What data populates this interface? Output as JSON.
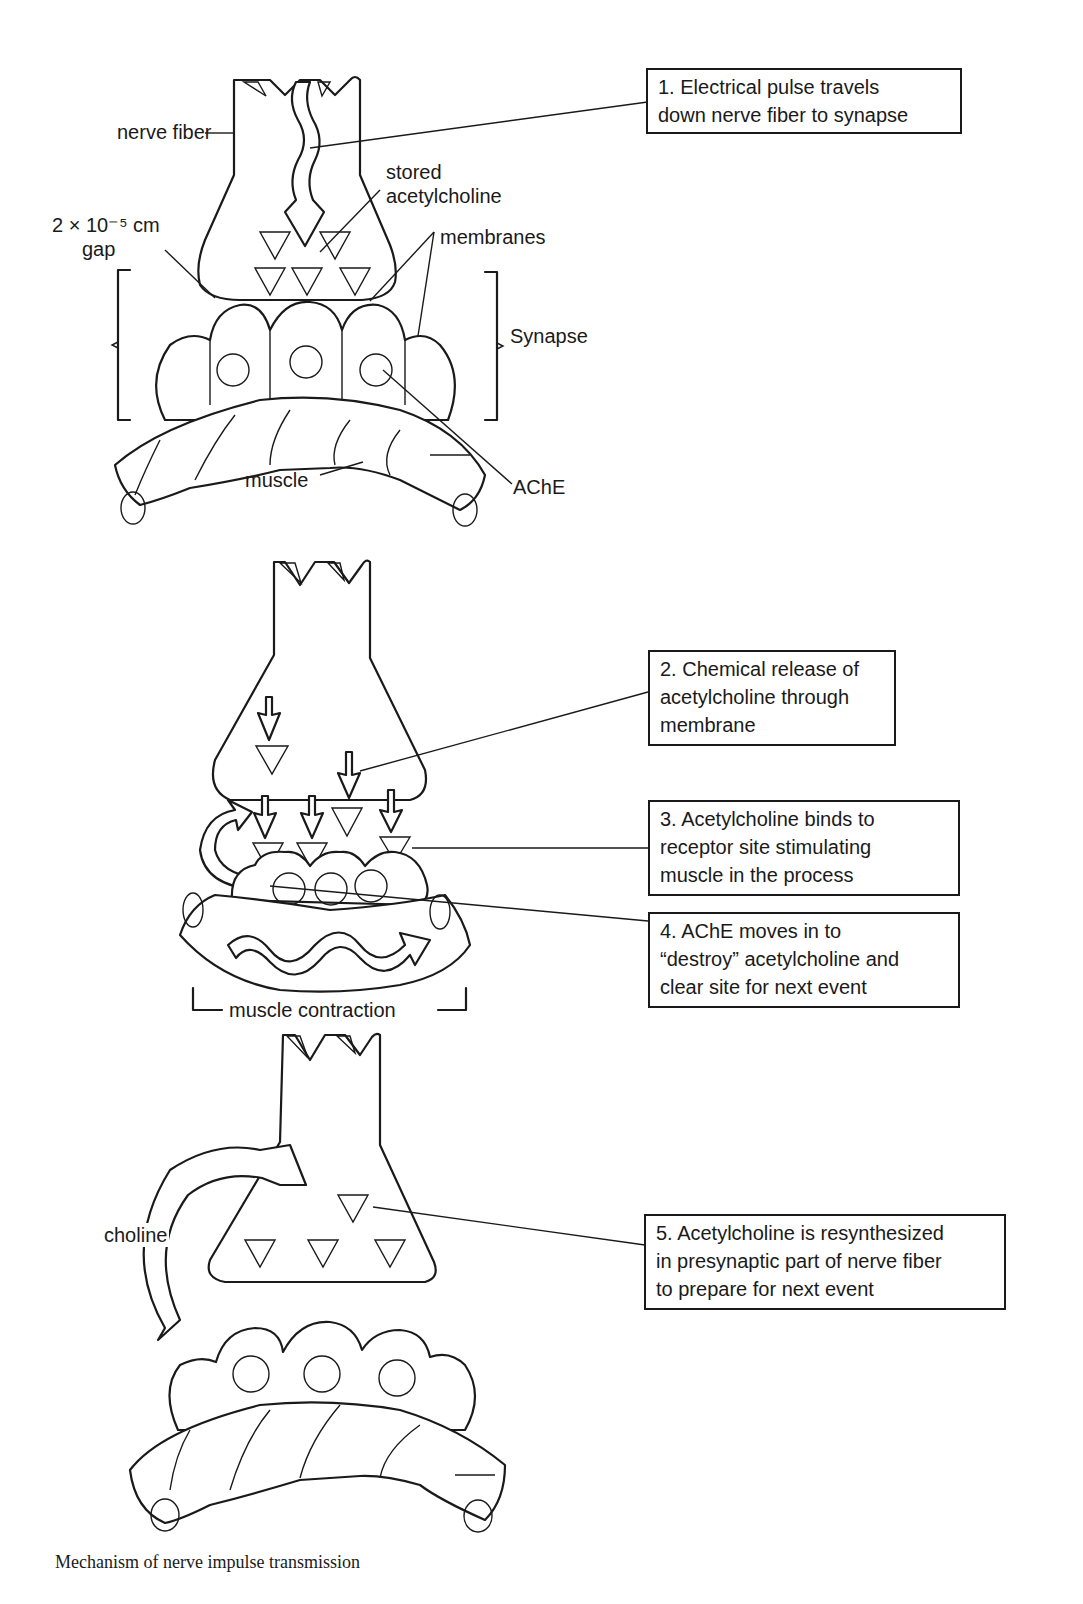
{
  "figure": {
    "caption": "Mechanism of nerve impulse transmission",
    "colors": {
      "ink": "#1a1a1a",
      "paper": "#ffffff",
      "stipple": "#555555"
    }
  },
  "panel1": {
    "labels": {
      "nerve_fiber": "nerve fiber",
      "stored_ach_line1": "stored",
      "stored_ach_line2": "acetylcholine",
      "gap_line1": "2 × 10⁻⁵ cm",
      "gap_line2": "gap",
      "membranes": "membranes",
      "synapse": "Synapse",
      "muscle": "muscle",
      "ache": "AChE"
    },
    "step": {
      "number": "1.",
      "lines": [
        "1.  Electrical pulse  travels",
        "down nerve  fiber to synapse"
      ]
    }
  },
  "panel2": {
    "labels": {
      "muscle_contraction": "muscle contraction"
    },
    "steps": [
      {
        "number": "2.",
        "lines": [
          "2.  Chemical release of",
          "acetylcholine through",
          "membrane"
        ]
      },
      {
        "number": "3.",
        "lines": [
          "3.  Acetylcholine binds to",
          "receptor site  stimulating",
          "muscle in  the process"
        ]
      },
      {
        "number": "4.",
        "lines": [
          "4.  AChE moves in to",
          "“destroy” acetylcholine and",
          "clear site for  next event"
        ]
      }
    ]
  },
  "panel3": {
    "labels": {
      "choline": "choline"
    },
    "step": {
      "number": "5.",
      "lines": [
        "5.  Acetylcholine is resynthesized",
        "in presynaptic part  of nerve fiber",
        "to prepare for next  event"
      ]
    }
  }
}
